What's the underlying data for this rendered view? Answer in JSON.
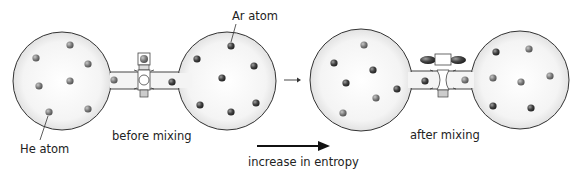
{
  "labels": {
    "ar_atom": "Ar atom",
    "he_atom": "He atom",
    "before": "before mixing",
    "after": "after mixing",
    "entropy": "increase in entropy"
  },
  "colors": {
    "flask_fill": "#f2f2f2",
    "flask_stroke": "#333333",
    "atom_he": "#8a8a8a",
    "atom_ar": "#4a4a4a",
    "arrow": "#111111"
  },
  "panels": [
    {
      "name": "before-mixing",
      "valve": "closed"
    },
    {
      "name": "after-mixing",
      "valve": "open"
    }
  ]
}
